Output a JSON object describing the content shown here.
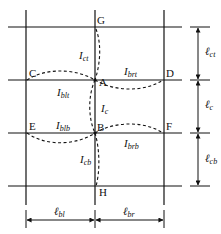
{
  "diagram": {
    "nodes": {
      "G": "G",
      "C": "C",
      "A": "A",
      "D": "D",
      "E": "E",
      "B": "B",
      "F": "F",
      "H": "H"
    },
    "stiffness_labels": {
      "ict": {
        "main": "I",
        "sub": "ct"
      },
      "ibrt": {
        "main": "I",
        "sub": "brt"
      },
      "iblt": {
        "main": "I",
        "sub": "blt"
      },
      "ic": {
        "main": "I",
        "sub": "c"
      },
      "iblb": {
        "main": "I",
        "sub": "blb"
      },
      "ibrb": {
        "main": "I",
        "sub": "brb"
      },
      "icb": {
        "main": "I",
        "sub": "cb"
      }
    },
    "length_labels": {
      "lct": {
        "main": "ℓ",
        "sub": "ct"
      },
      "lc": {
        "main": "ℓ",
        "sub": "c"
      },
      "lcb": {
        "main": "ℓ",
        "sub": "cb"
      },
      "lbl": {
        "main": "ℓ",
        "sub": "bl"
      },
      "lbr": {
        "main": "ℓ",
        "sub": "br"
      }
    }
  }
}
